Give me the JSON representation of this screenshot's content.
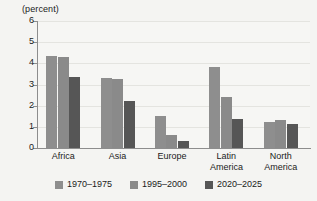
{
  "chart_data": {
    "type": "bar",
    "title": "(percent)",
    "xlabel": "",
    "ylabel": "",
    "ylim": [
      0,
      6
    ],
    "yticks": [
      "0",
      "1",
      "2",
      "3",
      "4",
      "5",
      "6"
    ],
    "grid": true,
    "legend_position": "bottom",
    "categories": [
      "Africa",
      "Asia",
      "Europe",
      "Latin\nAmerica",
      "North\nAmerica"
    ],
    "series": [
      {
        "name": "1970–1975",
        "color": "#8e8e8e",
        "values": [
          4.35,
          3.3,
          1.5,
          3.85,
          1.25
        ]
      },
      {
        "name": "1995–2000",
        "color": "#8a8a8a",
        "values": [
          4.3,
          3.25,
          0.6,
          2.4,
          1.3
        ]
      },
      {
        "name": "2020–2025",
        "color": "#565656",
        "values": [
          3.35,
          2.2,
          0.35,
          1.35,
          1.15
        ]
      }
    ]
  },
  "figure": {
    "background": "#f4f4f2",
    "axis_color": "#8d8d8d",
    "grid_color": "#e4e4e0"
  }
}
